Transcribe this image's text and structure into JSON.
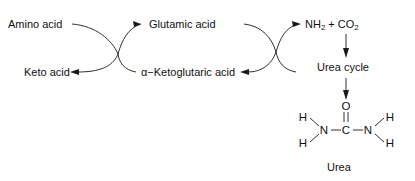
{
  "diagram": {
    "stroke_color": "#1a1a1a",
    "text_color": "#111111",
    "background": "#ffffff"
  },
  "labels": {
    "amino_acid": "Amino acid",
    "keto_acid": "Keto acid",
    "glutamic_acid": "Glutamic acid",
    "ketoglutaric_acid": "α−Ketoglutaric acid",
    "ammonia_plus_co2": "NH2 + CO2",
    "ammonia": "NH",
    "ammonia_sub": "2",
    "plus": "+",
    "co2": "CO",
    "co2_sub": "2",
    "urea_cycle": "Urea cycle",
    "urea": "Urea"
  },
  "molecule": {
    "name": "Urea",
    "atoms": {
      "h_top_left": "H",
      "h_bottom_left": "H",
      "n_left": "N",
      "c_center": "C",
      "o_top": "O",
      "n_right": "N",
      "h_top_right": "H",
      "h_bottom_right": "H"
    },
    "bonds": [
      "H-N left upper single",
      "H-N left lower single",
      "N-C left single",
      "C=O double",
      "C-N right single",
      "N-H right upper single",
      "N-H right lower single"
    ]
  },
  "arrows": {
    "left_cross_up": "Amino acid to Glutamic acid",
    "left_cross_down": "alpha-Ketoglutaric acid to Keto acid",
    "right_cross_up": "Glutamic acid to NH2 + CO2",
    "right_cross_down": "to alpha-Ketoglutaric acid",
    "vertical_top": "NH2 + CO2 to Urea cycle",
    "vertical_bottom": "Urea cycle to Urea"
  }
}
